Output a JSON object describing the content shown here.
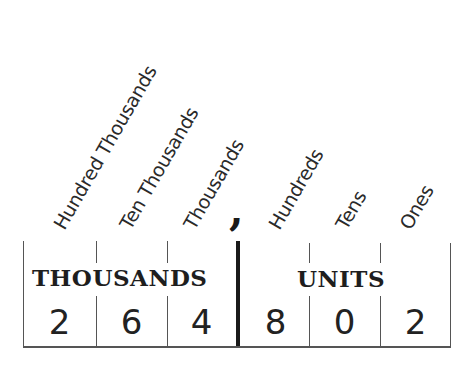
{
  "place_labels": [
    {
      "name": "hundred-thousands",
      "label": "Hundred Thousands"
    },
    {
      "name": "ten-thousands",
      "label": "Ten Thousands"
    },
    {
      "name": "thousands",
      "label": "Thousands"
    },
    {
      "name": "hundreds",
      "label": "Hundreds"
    },
    {
      "name": "tens",
      "label": "Tens"
    },
    {
      "name": "ones",
      "label": "Ones"
    }
  ],
  "separator": ",",
  "groups": {
    "thousands": "THOUSANDS",
    "units": "UNITS"
  },
  "digits": [
    "2",
    "6",
    "4",
    "8",
    "0",
    "2"
  ],
  "number": "264,802"
}
